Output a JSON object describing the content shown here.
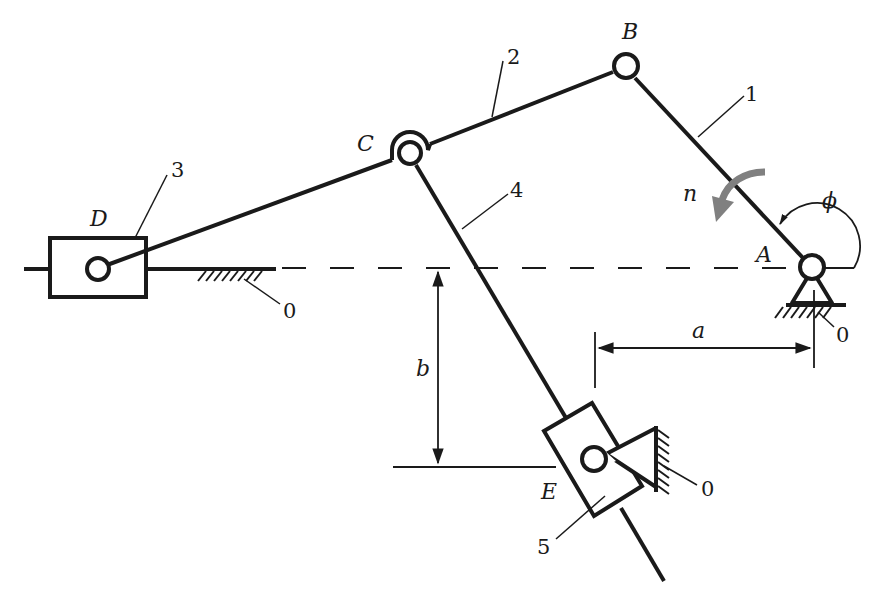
{
  "diagram": {
    "type": "planar linkage mechanism",
    "colors": {
      "ink": "#1a1a1a",
      "rotation_arrow": "#808080",
      "background": "#ffffff"
    },
    "joints": {
      "A": {
        "label": "A",
        "kind": "fixed pivot"
      },
      "B": {
        "label": "B",
        "kind": "revolute"
      },
      "C": {
        "label": "C",
        "kind": "revolute (double)"
      },
      "D": {
        "label": "D",
        "kind": "slider pin"
      },
      "E": {
        "label": "E",
        "kind": "fixed pivot with swinging slider"
      }
    },
    "links": [
      {
        "id": "1",
        "label": "1",
        "name": "crank AB"
      },
      {
        "id": "2",
        "label": "2",
        "name": "coupler BC"
      },
      {
        "id": "3",
        "label": "3",
        "name": "slider D"
      },
      {
        "id": "4",
        "label": "4",
        "name": "rod CE"
      },
      {
        "id": "5",
        "label": "5",
        "name": "swinging slider E"
      }
    ],
    "ground_labels": [
      "0",
      "0",
      "0"
    ],
    "dimensions": {
      "a": "a",
      "b": "b"
    },
    "angle": {
      "symbol": "ϕ"
    },
    "rotation": {
      "symbol": "n",
      "direction": "counterclockwise"
    }
  }
}
